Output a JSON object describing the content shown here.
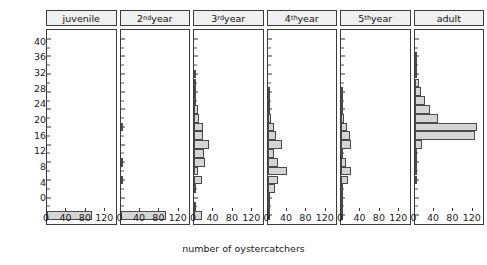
{
  "chart_data": {
    "type": "bar",
    "orientation": "horizontal",
    "title": "",
    "xlabel": "number of oystercatchers",
    "ylabel": "weeks absent during summer",
    "xlim": [
      0,
      145
    ],
    "ylim": [
      -2,
      42
    ],
    "xticks": [
      0,
      40,
      80,
      120
    ],
    "yticks": [
      0,
      4,
      8,
      12,
      16,
      20,
      24,
      28,
      32,
      36,
      40
    ],
    "y_minor_tick_step": 2,
    "bin_width": 2,
    "grid": false,
    "legend": null,
    "panels": [
      {
        "label": "juvenile",
        "label_base": "juvenile",
        "label_sup": "",
        "bins": [
          0
        ],
        "values": [
          95
        ]
      },
      {
        "label": "2nd year",
        "label_base": "2",
        "label_sup": "nd",
        "label_rest": " year",
        "bins": [
          0,
          8,
          12,
          20
        ],
        "values": [
          97,
          5,
          4,
          6
        ]
      },
      {
        "label": "3rd year",
        "label_base": "3",
        "label_sup": "rd",
        "label_rest": " year",
        "bins": [
          0,
          2,
          6,
          8,
          10,
          12,
          14,
          16,
          18,
          20,
          22,
          24,
          26,
          28,
          30,
          32
        ],
        "values": [
          17,
          3,
          2,
          16,
          8,
          23,
          22,
          32,
          19,
          20,
          11,
          9,
          3,
          2,
          2,
          2
        ]
      },
      {
        "label": "4th year",
        "label_base": "4",
        "label_sup": "th",
        "label_rest": " year",
        "bins": [
          0,
          2,
          4,
          6,
          8,
          10,
          12,
          14,
          16,
          18,
          20,
          22,
          24,
          26,
          28
        ],
        "values": [
          2,
          2,
          3,
          16,
          23,
          41,
          23,
          13,
          30,
          19,
          13,
          8,
          6,
          3,
          2
        ]
      },
      {
        "label": "5th year",
        "label_base": "5",
        "label_sup": "th",
        "label_rest": " year",
        "bins": [
          0,
          2,
          4,
          6,
          8,
          10,
          12,
          14,
          16,
          18,
          20,
          22,
          24,
          26,
          28
        ],
        "values": [
          2,
          2,
          2,
          4,
          14,
          22,
          10,
          5,
          22,
          18,
          12,
          7,
          4,
          2,
          2
        ]
      },
      {
        "label": "adult",
        "label_base": "adult",
        "label_sup": "",
        "bins": [
          8,
          10,
          12,
          14,
          16,
          18,
          20,
          22,
          24,
          26,
          28,
          30,
          32,
          34,
          36
        ],
        "values": [
          2,
          2,
          2,
          2,
          16,
          129,
          132,
          50,
          33,
          22,
          14,
          10,
          6,
          4,
          3
        ]
      }
    ]
  },
  "axis": {
    "y_title": "weeks absent during summer",
    "x_title": "number of oystercatchers",
    "y_tick_labels": [
      "40",
      "36",
      "32",
      "28",
      "24",
      "20",
      "16",
      "12",
      "8",
      "4",
      "0"
    ],
    "x_tick_labels": [
      "0",
      "40",
      "80",
      "120"
    ]
  },
  "style": {
    "bar_fill": "#d5d5d5",
    "bar_stroke": "#4a4a4a",
    "strip_fill": "#f0f0f0",
    "axis_color": "#3c3c3c",
    "background": "#ffffff"
  }
}
